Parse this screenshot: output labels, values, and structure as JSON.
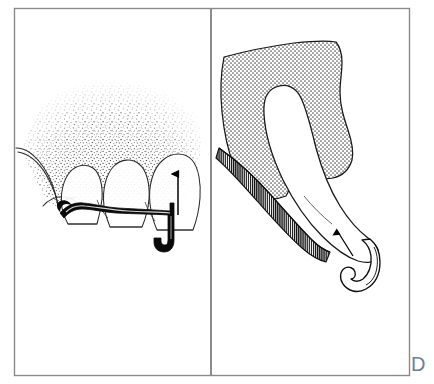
{
  "figure": {
    "label": "D",
    "label_color": "#6b8296",
    "caption": "",
    "background_color": "#ffffff",
    "frame": {
      "stroke_color": "#8a8a8a",
      "stroke_width": 1.4,
      "x": 14,
      "y": 8,
      "width": 396,
      "height": 368
    },
    "divider": {
      "name": "panel-divider",
      "x": 211,
      "y1": 9,
      "y2": 375,
      "stroke_color": "#5a5a5a",
      "stroke_width": 1.3
    },
    "panels": [
      {
        "id": "left-panel",
        "name": "clinical-view-panel",
        "title": "Clinical view of curette insertion at gingival margin",
        "elements": [
          {
            "name": "gingiva-stippled-tissue",
            "description": "Stippled gingival tissue with interdental papillae",
            "fill": "#ffffff",
            "stipple_color": "#1a1a1a"
          },
          {
            "name": "tooth-crowns",
            "description": "Three anterior tooth crowns with outlines",
            "fill": "#ffffff",
            "stroke": "#2b2b2b"
          },
          {
            "name": "lip-retraction-outline",
            "description": "Retracted lip and vestibule contour line",
            "stroke": "#2b2b2b"
          },
          {
            "name": "curette-instrument-shaft",
            "description": "Dark curette shaft lying along the gingival sulcus",
            "fill": "#000000"
          },
          {
            "name": "insertion-direction-arrow",
            "description": "Vertical arrow indicating apical stroke direction",
            "stroke": "#000000"
          }
        ]
      },
      {
        "id": "right-panel",
        "name": "cross-section-panel",
        "title": "Cross-section of curette blade adapted to root surface",
        "elements": [
          {
            "name": "gingival-tissue-crosshatch",
            "description": "Dotted / cross-hatched gingival connective tissue",
            "fill": "#d9d9d9",
            "pattern": "dot-grid"
          },
          {
            "name": "root-surface-hatching",
            "description": "Dense vertical line hatching representing root surface",
            "fill": "#111111",
            "pattern": "vertical-lines"
          },
          {
            "name": "curette-blade-body",
            "description": "White elongated curette blade shank within the sulcus",
            "fill": "#ffffff",
            "stroke": "#1a1a1a"
          },
          {
            "name": "curette-working-tip",
            "description": "Curved hook-shaped working end of the curette",
            "fill": "#ffffff",
            "stroke": "#111111"
          },
          {
            "name": "blade-angulation-arrow",
            "description": "Small arrow showing blade face angulation",
            "stroke": "#000000"
          }
        ]
      }
    ]
  }
}
